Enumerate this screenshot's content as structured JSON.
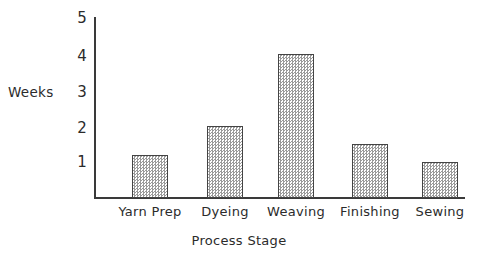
{
  "chart_data": {
    "type": "bar",
    "title": "",
    "subtitle": "",
    "xlabel": "Process Stage",
    "ylabel": "Weeks",
    "categories": [
      "Yarn Prep",
      "Dyeing",
      "Weaving",
      "Finishing",
      "Sewing"
    ],
    "values": [
      1.2,
      2,
      4,
      1.5,
      1
    ],
    "ylim": [
      0,
      5
    ],
    "ytick_labels": [
      "1",
      "2",
      "3",
      "4",
      "5"
    ],
    "ytick_values": [
      1,
      2,
      3,
      4,
      5
    ],
    "grid": false,
    "legend": null,
    "legend_position": "none",
    "annotations": [],
    "colors": {
      "bar_fill": "#d0d0d0",
      "bar_edge": "#444444",
      "axis": "#3a3a3a",
      "text": "#2b2b2b",
      "background": "#ffffff"
    }
  },
  "axes": {
    "y_title": "Weeks",
    "x_title": "Process Stage"
  }
}
